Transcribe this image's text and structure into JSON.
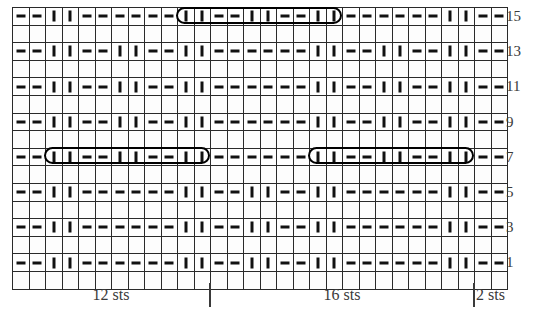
{
  "chart_data": {
    "type": "table",
    "grid_columns": 30,
    "grid_rows": 16,
    "symbol_legend": {
      "purl": "-",
      "knit": "|",
      "cable": "cable-cross-bracket"
    },
    "row_labels": [
      "15",
      "13",
      "11",
      "9",
      "7",
      "5",
      "3",
      "1"
    ],
    "column_group_labels": [
      "12 sts",
      "16 sts",
      "2 sts"
    ],
    "column_group_widths": [
      12,
      16,
      2
    ],
    "rows": [
      {
        "label": "15",
        "cells": [
          "-",
          "-",
          "|",
          "|",
          "-",
          "-",
          "-",
          "-",
          "-",
          "-",
          "|",
          "|",
          "-",
          "-",
          "|",
          "|",
          "-",
          "-",
          "|",
          "|",
          "-",
          "-",
          "-",
          "-",
          "-",
          "-",
          "|",
          "|",
          "-",
          "-"
        ],
        "cables": [
          {
            "start": 10,
            "span": 10
          }
        ]
      },
      {
        "label": "",
        "cells": [],
        "cables": []
      },
      {
        "label": "13",
        "cells": [
          "-",
          "-",
          "|",
          "|",
          "-",
          "-",
          "|",
          "|",
          "-",
          "-",
          "|",
          "|",
          "-",
          "-",
          "-",
          "-",
          "-",
          "-",
          "|",
          "|",
          "-",
          "-",
          "|",
          "|",
          "-",
          "-",
          "|",
          "|",
          "-",
          "-"
        ],
        "cables": []
      },
      {
        "label": "",
        "cells": [],
        "cables": []
      },
      {
        "label": "11",
        "cells": [
          "-",
          "-",
          "|",
          "|",
          "-",
          "-",
          "|",
          "|",
          "-",
          "-",
          "|",
          "|",
          "-",
          "-",
          "-",
          "-",
          "-",
          "-",
          "|",
          "|",
          "-",
          "-",
          "|",
          "|",
          "-",
          "-",
          "|",
          "|",
          "-",
          "-"
        ],
        "cables": []
      },
      {
        "label": "",
        "cells": [],
        "cables": []
      },
      {
        "label": "9",
        "cells": [
          "-",
          "-",
          "|",
          "|",
          "-",
          "-",
          "|",
          "|",
          "-",
          "-",
          "|",
          "|",
          "-",
          "-",
          "-",
          "-",
          "-",
          "-",
          "|",
          "|",
          "-",
          "-",
          "|",
          "|",
          "-",
          "-",
          "|",
          "|",
          "-",
          "-"
        ],
        "cables": []
      },
      {
        "label": "",
        "cells": [],
        "cables": []
      },
      {
        "label": "7",
        "cells": [
          "-",
          "-",
          "|",
          "|",
          "-",
          "-",
          "|",
          "|",
          "-",
          "-",
          "|",
          "|",
          "-",
          "-",
          "-",
          "-",
          "-",
          "-",
          "|",
          "|",
          "-",
          "-",
          "|",
          "|",
          "-",
          "-",
          "|",
          "|",
          "-",
          "-"
        ],
        "cables": [
          {
            "start": 2,
            "span": 10
          },
          {
            "start": 18,
            "span": 10
          }
        ]
      },
      {
        "label": "",
        "cells": [],
        "cables": []
      },
      {
        "label": "5",
        "cells": [
          "-",
          "-",
          "|",
          "|",
          "-",
          "-",
          "-",
          "-",
          "-",
          "-",
          "|",
          "|",
          "-",
          "-",
          "|",
          "|",
          "-",
          "-",
          "|",
          "|",
          "-",
          "-",
          "-",
          "-",
          "-",
          "-",
          "|",
          "|",
          "-",
          "-"
        ],
        "cables": []
      },
      {
        "label": "",
        "cells": [],
        "cables": []
      },
      {
        "label": "3",
        "cells": [
          "-",
          "-",
          "|",
          "|",
          "-",
          "-",
          "-",
          "-",
          "-",
          "-",
          "|",
          "|",
          "-",
          "-",
          "|",
          "|",
          "-",
          "-",
          "|",
          "|",
          "-",
          "-",
          "-",
          "-",
          "-",
          "-",
          "|",
          "|",
          "-",
          "-"
        ],
        "cables": []
      },
      {
        "label": "",
        "cells": [],
        "cables": []
      },
      {
        "label": "1",
        "cells": [
          "-",
          "-",
          "|",
          "|",
          "-",
          "-",
          "-",
          "-",
          "-",
          "-",
          "|",
          "|",
          "-",
          "-",
          "|",
          "|",
          "-",
          "-",
          "|",
          "|",
          "-",
          "-",
          "-",
          "-",
          "-",
          "-",
          "|",
          "|",
          "-",
          "-"
        ],
        "cables": []
      },
      {
        "label": "",
        "cells": [],
        "cables": []
      }
    ]
  },
  "legend": {
    "groups": [
      {
        "label": "12 sts",
        "center_col": 6
      },
      {
        "label": "16 sts",
        "center_col": 20
      },
      {
        "label": "2 sts",
        "center_col": 29
      }
    ],
    "dividers": [
      12,
      28
    ]
  },
  "colors": {
    "ink": "#111111",
    "grid_line": "#2a2a2a",
    "label_text": "#3a3a3a",
    "background": "#ffffff"
  }
}
